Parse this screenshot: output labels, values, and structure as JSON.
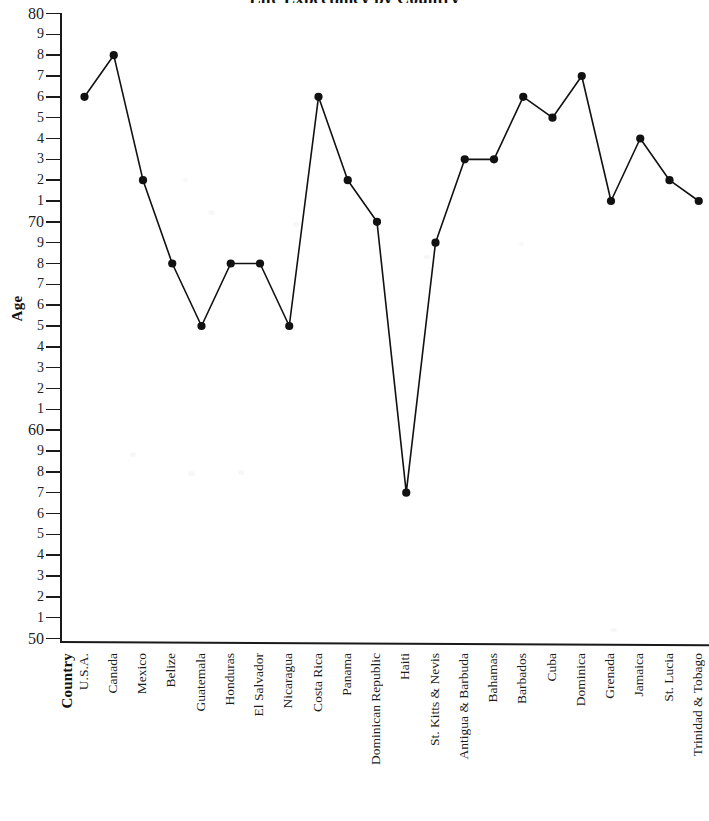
{
  "chart": {
    "title": "Life Expectancy by Country",
    "x_axis_title": "Country",
    "y_axis_title": "Age"
  },
  "chart_data": {
    "type": "line",
    "title": "Life Expectancy by Country",
    "xlabel": "Country",
    "ylabel": "Age",
    "ylim": [
      50,
      80
    ],
    "grid": false,
    "legend": "none",
    "y_tick_labels": [
      "80",
      "9",
      "8",
      "7",
      "6",
      "5",
      "4",
      "3",
      "2",
      "1",
      "70",
      "9",
      "8",
      "7",
      "6",
      "5",
      "4",
      "3",
      "2",
      "1",
      "60",
      "9",
      "8",
      "7",
      "6",
      "5",
      "4",
      "3",
      "2",
      "1",
      "50"
    ],
    "y_tick_values": [
      80,
      79,
      78,
      77,
      76,
      75,
      74,
      73,
      72,
      71,
      70,
      69,
      68,
      67,
      66,
      65,
      64,
      63,
      62,
      61,
      60,
      59,
      58,
      57,
      56,
      55,
      54,
      53,
      52,
      51,
      50
    ],
    "categories": [
      "U.S.A.",
      "Canada",
      "Mexico",
      "Belize",
      "Guatemala",
      "Honduras",
      "El Salvador",
      "Nicaragua",
      "Costa Rica",
      "Panama",
      "Dominican Republic",
      "Haiti",
      "St. Kitts & Nevis",
      "Antigua & Barbuda",
      "Bahamas",
      "Barbados",
      "Cuba",
      "Dominica",
      "Grenada",
      "Jamaica",
      "St. Lucia",
      "Trinidad & Tobago"
    ],
    "values": [
      76,
      78,
      72,
      68,
      65,
      68,
      68,
      65,
      76,
      72,
      70,
      57,
      69,
      73,
      73,
      76,
      75,
      77,
      71,
      74,
      72,
      71
    ],
    "marker": "filled-circle",
    "line_color": "#111111",
    "marker_color": "#111111"
  }
}
